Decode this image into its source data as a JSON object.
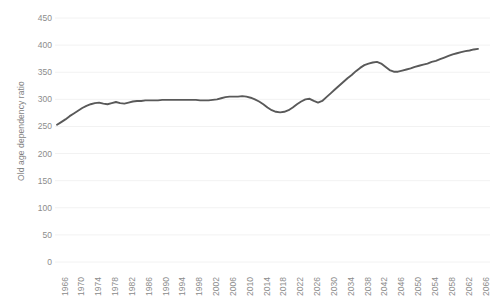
{
  "chart_data": {
    "type": "line",
    "title": "",
    "xlabel": "",
    "ylabel": "Old age dependency ratio",
    "ylim": [
      0,
      450
    ],
    "yticks": [
      0,
      50,
      100,
      150,
      200,
      250,
      300,
      350,
      400,
      450
    ],
    "xticks": [
      "1966",
      "1970",
      "1974",
      "1978",
      "1982",
      "1986",
      "1990",
      "1994",
      "1998",
      "2002",
      "2006",
      "2010",
      "2014",
      "2018",
      "2022",
      "2026",
      "2030",
      "2034",
      "2038",
      "2042",
      "2046",
      "2050",
      "2054",
      "2058",
      "2062",
      "2066"
    ],
    "grid": true,
    "legend": false,
    "line_color": "#595959",
    "grid_color": "#f2f2f2",
    "tick_label_color": "#8c8c8c",
    "axis_title_color": "#7f7f7f",
    "background_color": "#ffffff",
    "x": [
      1966,
      1967,
      1968,
      1969,
      1970,
      1971,
      1972,
      1973,
      1974,
      1975,
      1976,
      1977,
      1978,
      1979,
      1980,
      1981,
      1982,
      1983,
      1984,
      1985,
      1986,
      1987,
      1988,
      1989,
      1990,
      1991,
      1992,
      1993,
      1994,
      1995,
      1996,
      1997,
      1998,
      1999,
      2000,
      2001,
      2002,
      2003,
      2004,
      2005,
      2006,
      2007,
      2008,
      2009,
      2010,
      2011,
      2012,
      2013,
      2014,
      2015,
      2016,
      2017,
      2018,
      2019,
      2020,
      2021,
      2022,
      2023,
      2024,
      2025,
      2026,
      2027,
      2028,
      2029,
      2030,
      2031,
      2032,
      2033,
      2034,
      2035,
      2036,
      2037,
      2038,
      2039,
      2040,
      2041,
      2042,
      2043,
      2044,
      2045,
      2046,
      2047,
      2048,
      2049,
      2050,
      2051,
      2052,
      2053,
      2054,
      2055,
      2056,
      2057,
      2058,
      2059,
      2060,
      2061,
      2062,
      2063,
      2064,
      2065,
      2066
    ],
    "values": [
      253,
      258,
      263,
      269,
      274,
      279,
      284,
      288,
      291,
      293,
      294,
      292,
      291,
      293,
      295,
      293,
      292,
      294,
      296,
      297,
      297,
      298,
      298,
      298,
      298,
      299,
      299,
      299,
      299,
      299,
      299,
      299,
      299,
      299,
      298,
      298,
      298,
      299,
      300,
      302,
      304,
      305,
      305,
      305,
      306,
      305,
      303,
      300,
      296,
      291,
      285,
      280,
      277,
      276,
      277,
      280,
      285,
      291,
      296,
      300,
      301,
      297,
      294,
      297,
      304,
      311,
      318,
      325,
      332,
      339,
      345,
      352,
      358,
      363,
      366,
      368,
      369,
      366,
      360,
      354,
      351,
      351,
      353,
      355,
      357,
      360,
      362,
      364,
      366,
      369,
      371,
      374,
      377,
      380,
      383,
      385,
      387,
      389,
      390,
      392,
      393
    ],
    "series_name": "Old age dependency ratio"
  }
}
